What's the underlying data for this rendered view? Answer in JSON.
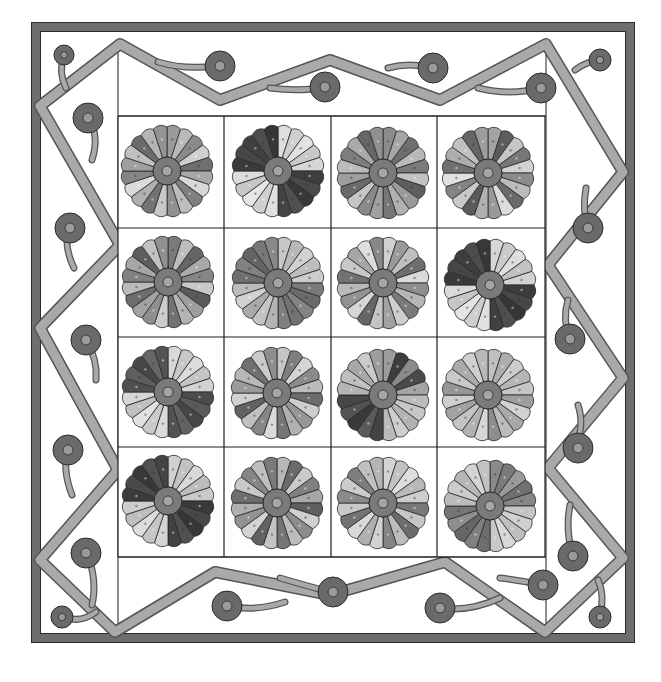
{
  "illustration": {
    "title": "Dresden Plate quilt with vine border",
    "canvas": {
      "width": 661,
      "height": 682
    },
    "colors": {
      "background": "#ffffff",
      "outer_border": "#6e6e6e",
      "outline": "#2a2a2a",
      "vine": "#a9a9a9",
      "vine_edge": "#555555",
      "berry": "#6a6a6a",
      "berry_center": "#9a9a9a",
      "plate_center": "#7a7a7a",
      "plate_center_inner": "#a5a5a5",
      "grid_line": "#1e1e1e"
    },
    "outer_border": {
      "x": 36,
      "y": 27,
      "w": 594,
      "h": 611,
      "thickness": 9
    },
    "inner_frame": {
      "x1": 118,
      "y1": 42,
      "x2": 546,
      "y2": 632
    },
    "block_grid": {
      "x": 118,
      "y": 116,
      "cols": 4,
      "rows": 4,
      "col_edges": [
        118,
        224,
        331,
        437,
        545
      ],
      "row_edges": [
        116,
        228,
        337,
        447,
        557
      ]
    },
    "plates": [
      {
        "row": 0,
        "col": 0,
        "cx": 167,
        "cy": 171,
        "r": 47,
        "petals": 20,
        "tones": [
          "#9a9a9a",
          "#b9b9b9",
          "#8a8a8a",
          "#cfcfcf",
          "#6f6f6f",
          "#a8a8a8",
          "#d8d8d8",
          "#7f7f7f",
          "#bdbdbd",
          "#909090",
          "#c8c8c8",
          "#747474",
          "#b0b0b0",
          "#dadada",
          "#858585",
          "#a0a0a0",
          "#c0c0c0",
          "#6a6a6a",
          "#b5b5b5",
          "#949494"
        ]
      },
      {
        "row": 0,
        "col": 1,
        "cx": 278,
        "cy": 171,
        "r": 47,
        "petals": 20,
        "tones": [
          "#dedede",
          "#cfcfcf",
          "#e2e2e2",
          "#c8c8c8",
          "#d6d6d6",
          "#3e3e3e",
          "#4a4a4a",
          "#383838",
          "#505050",
          "#444444",
          "#e0e0e0",
          "#d0d0d0",
          "#e6e6e6",
          "#c6c6c6",
          "#dcdcdc",
          "#3a3a3a",
          "#474747",
          "#404040",
          "#4e4e4e",
          "#363636"
        ]
      },
      {
        "row": 0,
        "col": 2,
        "cx": 383,
        "cy": 173,
        "r": 47,
        "petals": 20,
        "tones": [
          "#8c8c8c",
          "#a6a6a6",
          "#6e6e6e",
          "#b8b8b8",
          "#7a7a7a",
          "#c2c2c2",
          "#5e5e5e",
          "#9a9a9a",
          "#b0b0b0",
          "#767676",
          "#a0a0a0",
          "#8a8a8a",
          "#c6c6c6",
          "#6a6a6a",
          "#9e9e9e",
          "#bbbbbb",
          "#7e7e7e",
          "#aaaaaa",
          "#666666",
          "#909090"
        ]
      },
      {
        "row": 0,
        "col": 3,
        "cx": 488,
        "cy": 173,
        "r": 47,
        "petals": 20,
        "tones": [
          "#a4a4a4",
          "#5c5c5c",
          "#c6c6c6",
          "#787878",
          "#d2d2d2",
          "#8c8c8c",
          "#bcbcbc",
          "#6a6a6a",
          "#dcdcdc",
          "#989898",
          "#b0b0b0",
          "#5a5a5a",
          "#cacaca",
          "#848484",
          "#e0e0e0",
          "#707070",
          "#aeaeae",
          "#c0c0c0",
          "#666666",
          "#9c9c9c"
        ]
      },
      {
        "row": 1,
        "col": 0,
        "cx": 168,
        "cy": 282,
        "r": 47,
        "petals": 20,
        "tones": [
          "#7a7a7a",
          "#bdbdbd",
          "#666666",
          "#a9a9a9",
          "#868686",
          "#c8c8c8",
          "#5a5a5a",
          "#9e9e9e",
          "#b4b4b4",
          "#727272",
          "#cccccc",
          "#8e8e8e",
          "#a2a2a2",
          "#6c6c6c",
          "#bababa",
          "#808080",
          "#a6a6a6",
          "#5e5e5e",
          "#c2c2c2",
          "#909090"
        ]
      },
      {
        "row": 1,
        "col": 1,
        "cx": 278,
        "cy": 283,
        "r": 47,
        "petals": 20,
        "tones": [
          "#c8c8c8",
          "#b8b8b8",
          "#d2d2d2",
          "#bebebe",
          "#cccccc",
          "#7a7a7a",
          "#6a6a6a",
          "#848484",
          "#727272",
          "#7e7e7e",
          "#b4b4b4",
          "#c4c4c4",
          "#aaaaaa",
          "#d0d0d0",
          "#bcbcbc",
          "#6e6e6e",
          "#808080",
          "#646464",
          "#787878",
          "#888888"
        ]
      },
      {
        "row": 1,
        "col": 2,
        "cx": 383,
        "cy": 283,
        "r": 47,
        "petals": 20,
        "tones": [
          "#d0d0d0",
          "#9a9a9a",
          "#c0c0c0",
          "#6e6e6e",
          "#dadada",
          "#8e8e8e",
          "#b6b6b6",
          "#7a7a7a",
          "#cecece",
          "#a2a2a2",
          "#c4c4c4",
          "#666666",
          "#d6d6d6",
          "#929292",
          "#bababa",
          "#727272",
          "#c8c8c8",
          "#a6a6a6",
          "#dedede",
          "#888888"
        ]
      },
      {
        "row": 1,
        "col": 3,
        "cx": 490,
        "cy": 285,
        "r": 47,
        "petals": 20,
        "tones": [
          "#d6d6d6",
          "#cacaca",
          "#dedede",
          "#c2c2c2",
          "#d2d2d2",
          "#3c3c3c",
          "#474747",
          "#353535",
          "#4e4e4e",
          "#404040",
          "#e0e0e0",
          "#cecece",
          "#e4e4e4",
          "#c6c6c6",
          "#dadada",
          "#3a3a3a",
          "#464646",
          "#3e3e3e",
          "#4c4c4c",
          "#383838"
        ]
      },
      {
        "row": 2,
        "col": 0,
        "cx": 168,
        "cy": 392,
        "r": 47,
        "petals": 20,
        "tones": [
          "#d8d8d8",
          "#c8c8c8",
          "#dcdcdc",
          "#c4c4c4",
          "#d2d2d2",
          "#4c4c4c",
          "#5a5a5a",
          "#464646",
          "#626262",
          "#525252",
          "#dadada",
          "#cacaca",
          "#e2e2e2",
          "#c0c0c0",
          "#d6d6d6",
          "#505050",
          "#5e5e5e",
          "#484848",
          "#666666",
          "#545454"
        ]
      },
      {
        "row": 2,
        "col": 1,
        "cx": 277,
        "cy": 393,
        "r": 47,
        "petals": 20,
        "tones": [
          "#c6c6c6",
          "#7e7e7e",
          "#d4d4d4",
          "#8a8a8a",
          "#bcbcbc",
          "#6c6c6c",
          "#cecece",
          "#969696",
          "#b0b0b0",
          "#767676",
          "#dadada",
          "#868686",
          "#c0c0c0",
          "#626262",
          "#d0d0d0",
          "#9a9a9a",
          "#b8b8b8",
          "#707070",
          "#cacaca",
          "#8e8e8e"
        ]
      },
      {
        "row": 2,
        "col": 2,
        "cx": 383,
        "cy": 395,
        "r": 47,
        "petals": 20,
        "tones": [
          "#9c9c9c",
          "#3e3e3e",
          "#8a8a8a",
          "#4a4a4a",
          "#a4a4a4",
          "#bcbcbc",
          "#c6c6c6",
          "#b2b2b2",
          "#cecece",
          "#bababa",
          "#444444",
          "#5a5a5a",
          "#3a3a3a",
          "#525252",
          "#484848",
          "#b4b4b4",
          "#c0c0c0",
          "#a8a8a8",
          "#cacaca",
          "#9e9e9e"
        ]
      },
      {
        "row": 2,
        "col": 3,
        "cx": 488,
        "cy": 395,
        "r": 47,
        "petals": 20,
        "tones": [
          "#c0c0c0",
          "#aeaeae",
          "#cccccc",
          "#b6b6b6",
          "#c6c6c6",
          "#9e9e9e",
          "#d2d2d2",
          "#a8a8a8",
          "#bcbcbc",
          "#8e8e8e",
          "#d6d6d6",
          "#b2b2b2",
          "#c4c4c4",
          "#a2a2a2",
          "#cecece",
          "#969696",
          "#c8c8c8",
          "#aaaaaa",
          "#d0d0d0",
          "#b8b8b8"
        ]
      },
      {
        "row": 3,
        "col": 0,
        "cx": 168,
        "cy": 501,
        "r": 47,
        "petals": 20,
        "tones": [
          "#d0d0d0",
          "#c2c2c2",
          "#d8d8d8",
          "#bcbcbc",
          "#cacaca",
          "#3a3a3a",
          "#484848",
          "#363636",
          "#505050",
          "#424242",
          "#d4d4d4",
          "#c6c6c6",
          "#dcdcdc",
          "#bebebe",
          "#cecece",
          "#3c3c3c",
          "#4a4a4a",
          "#383838",
          "#525252",
          "#444444"
        ]
      },
      {
        "row": 3,
        "col": 1,
        "cx": 277,
        "cy": 503,
        "r": 47,
        "petals": 20,
        "tones": [
          "#b8b8b8",
          "#6a6a6a",
          "#cacaca",
          "#808080",
          "#a8a8a8",
          "#5e5e5e",
          "#d0d0d0",
          "#8c8c8c",
          "#bcbcbc",
          "#747474",
          "#c4c4c4",
          "#626262",
          "#d4d4d4",
          "#929292",
          "#b0b0b0",
          "#6e6e6e",
          "#c8c8c8",
          "#868686",
          "#bebebe",
          "#7a7a7a"
        ]
      },
      {
        "row": 3,
        "col": 2,
        "cx": 383,
        "cy": 503,
        "r": 47,
        "petals": 20,
        "tones": [
          "#d4d4d4",
          "#c2c2c2",
          "#dedede",
          "#b8b8b8",
          "#cecece",
          "#787878",
          "#c6c6c6",
          "#6c6c6c",
          "#bcbcbc",
          "#848484",
          "#d2d2d2",
          "#b0b0b0",
          "#dadada",
          "#727272",
          "#c8c8c8",
          "#8a8a8a",
          "#cccccc",
          "#7e7e7e",
          "#c0c0c0",
          "#b4b4b4"
        ]
      },
      {
        "row": 3,
        "col": 3,
        "cx": 490,
        "cy": 506,
        "r": 47,
        "petals": 20,
        "tones": [
          "#8a8a8a",
          "#7a7a7a",
          "#9a9a9a",
          "#707070",
          "#868686",
          "#c4c4c4",
          "#d0d0d0",
          "#bebebe",
          "#d8d8d8",
          "#c8c8c8",
          "#6e6e6e",
          "#808080",
          "#666666",
          "#8e8e8e",
          "#767676",
          "#bcbcbc",
          "#cccccc",
          "#b6b6b6",
          "#d4d4d4",
          "#c2c2c2"
        ]
      }
    ],
    "plate_center": {
      "r_outer": 14,
      "r_inner": 5
    },
    "vine": {
      "width": 10,
      "path": "M 120 44 L 40 106 L 120 245 L 40 328 L 118 470 L 40 560 L 115 632 L 215 572 L 330 595 L 445 562 L 545 632 L 623 558 L 548 468 L 623 378 L 548 265 L 623 172 L 546 44 L 440 100 L 330 60 L 220 100 Z"
    },
    "stems": [
      {
        "d": "M 64 55 Q 58 72 66 88"
      },
      {
        "d": "M 88 118 Q 100 135 92 160"
      },
      {
        "d": "M 216 66 Q 185 70 158 62"
      },
      {
        "d": "M 324 87 Q 300 92 270 88"
      },
      {
        "d": "M 432 68 Q 410 62 388 68"
      },
      {
        "d": "M 540 88 Q 510 96 478 88"
      },
      {
        "d": "M 600 60 Q 585 62 575 70"
      },
      {
        "d": "M 68 228 Q 64 248 74 268"
      },
      {
        "d": "M 86 340 Q 98 360 96 380"
      },
      {
        "d": "M 68 447 Q 62 470 72 495"
      },
      {
        "d": "M 86 550 Q 98 580 92 605"
      },
      {
        "d": "M 62 615 Q 78 625 96 612"
      },
      {
        "d": "M 228 606 Q 255 612 285 602"
      },
      {
        "d": "M 330 592 Q 300 584 280 578"
      },
      {
        "d": "M 440 608 Q 470 612 500 598"
      },
      {
        "d": "M 542 585 Q 518 580 500 578"
      },
      {
        "d": "M 573 556 Q 565 530 570 505"
      },
      {
        "d": "M 600 615 Q 605 595 598 580"
      },
      {
        "d": "M 575 449 Q 585 425 578 405"
      },
      {
        "d": "M 588 228 Q 582 210 586 188"
      },
      {
        "d": "M 570 339 Q 562 320 568 300"
      }
    ],
    "berries": [
      {
        "cx": 64,
        "cy": 55,
        "r": 10
      },
      {
        "cx": 88,
        "cy": 118,
        "r": 15
      },
      {
        "cx": 220,
        "cy": 66,
        "r": 15
      },
      {
        "cx": 325,
        "cy": 87,
        "r": 15
      },
      {
        "cx": 433,
        "cy": 68,
        "r": 15
      },
      {
        "cx": 541,
        "cy": 88,
        "r": 15
      },
      {
        "cx": 600,
        "cy": 60,
        "r": 11
      },
      {
        "cx": 70,
        "cy": 228,
        "r": 15
      },
      {
        "cx": 86,
        "cy": 340,
        "r": 15
      },
      {
        "cx": 68,
        "cy": 450,
        "r": 15
      },
      {
        "cx": 86,
        "cy": 553,
        "r": 15
      },
      {
        "cx": 62,
        "cy": 617,
        "r": 11
      },
      {
        "cx": 227,
        "cy": 606,
        "r": 15
      },
      {
        "cx": 333,
        "cy": 592,
        "r": 15
      },
      {
        "cx": 440,
        "cy": 608,
        "r": 15
      },
      {
        "cx": 543,
        "cy": 585,
        "r": 15
      },
      {
        "cx": 573,
        "cy": 556,
        "r": 15
      },
      {
        "cx": 600,
        "cy": 617,
        "r": 11
      },
      {
        "cx": 578,
        "cy": 448,
        "r": 15
      },
      {
        "cx": 588,
        "cy": 228,
        "r": 15
      },
      {
        "cx": 570,
        "cy": 339,
        "r": 15
      }
    ]
  }
}
